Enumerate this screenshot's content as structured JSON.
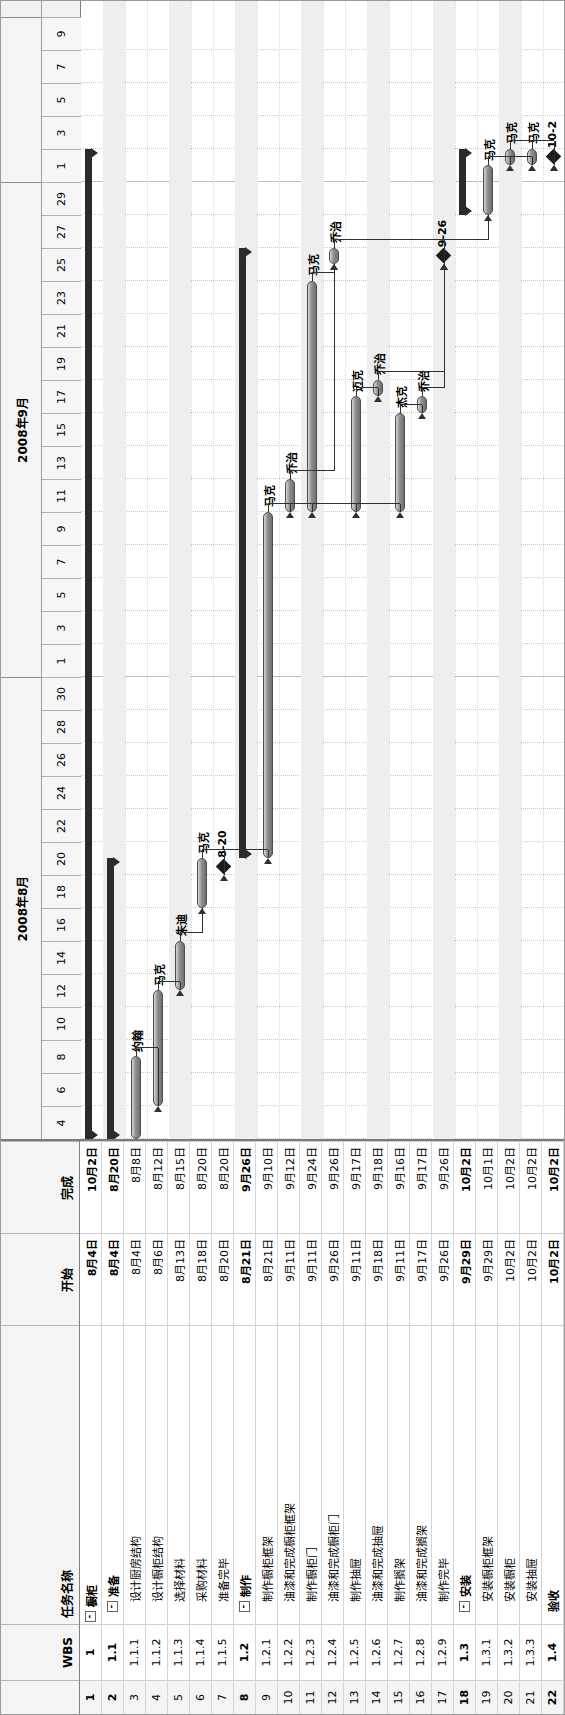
{
  "app": {
    "view": "gantt-chart",
    "orientation": "rotated-90-ccw"
  },
  "table": {
    "headers": {
      "id": "",
      "wbs": "WBS",
      "name": "任务名称",
      "start": "开始",
      "finish": "完成"
    },
    "rows": [
      {
        "id": "1",
        "wbs": "1",
        "name": "橱柜",
        "start": "8月4日",
        "finish": "10月2日",
        "level": 1,
        "collapse": "-",
        "summary": true
      },
      {
        "id": "2",
        "wbs": "1.1",
        "name": "准备",
        "start": "8月4日",
        "finish": "8月20日",
        "level": 2,
        "collapse": "-",
        "summary": true
      },
      {
        "id": "3",
        "wbs": "1.1.1",
        "name": "设计厨房结构",
        "start": "8月4日",
        "finish": "8月8日",
        "level": 3,
        "collapse": "",
        "summary": false
      },
      {
        "id": "4",
        "wbs": "1.1.2",
        "name": "设计橱柜结构",
        "start": "8月6日",
        "finish": "8月12日",
        "level": 3,
        "collapse": "",
        "summary": false
      },
      {
        "id": "5",
        "wbs": "1.1.3",
        "name": "选择材料",
        "start": "8月13日",
        "finish": "8月15日",
        "level": 3,
        "collapse": "",
        "summary": false
      },
      {
        "id": "6",
        "wbs": "1.1.4",
        "name": "采购材料",
        "start": "8月18日",
        "finish": "8月20日",
        "level": 3,
        "collapse": "",
        "summary": false
      },
      {
        "id": "7",
        "wbs": "1.1.5",
        "name": "准备完毕",
        "start": "8月20日",
        "finish": "8月20日",
        "level": 3,
        "collapse": "",
        "summary": false
      },
      {
        "id": "8",
        "wbs": "1.2",
        "name": "制作",
        "start": "8月21日",
        "finish": "9月26日",
        "level": 2,
        "collapse": "-",
        "summary": true
      },
      {
        "id": "9",
        "wbs": "1.2.1",
        "name": "制作橱柜框架",
        "start": "8月21日",
        "finish": "9月10日",
        "level": 3,
        "collapse": "",
        "summary": false
      },
      {
        "id": "10",
        "wbs": "1.2.2",
        "name": "油漆和完成橱柜框架",
        "start": "9月11日",
        "finish": "9月12日",
        "level": 3,
        "collapse": "",
        "summary": false
      },
      {
        "id": "11",
        "wbs": "1.2.3",
        "name": "制作橱柜门",
        "start": "9月11日",
        "finish": "9月24日",
        "level": 3,
        "collapse": "",
        "summary": false
      },
      {
        "id": "12",
        "wbs": "1.2.4",
        "name": "油漆和完成橱柜门",
        "start": "9月26日",
        "finish": "9月26日",
        "level": 3,
        "collapse": "",
        "summary": false
      },
      {
        "id": "13",
        "wbs": "1.2.5",
        "name": "制作抽屉",
        "start": "9月11日",
        "finish": "9月17日",
        "level": 3,
        "collapse": "",
        "summary": false
      },
      {
        "id": "14",
        "wbs": "1.2.6",
        "name": "油漆和完成抽屉",
        "start": "9月18日",
        "finish": "9月18日",
        "level": 3,
        "collapse": "",
        "summary": false
      },
      {
        "id": "15",
        "wbs": "1.2.7",
        "name": "制作搁架",
        "start": "9月11日",
        "finish": "9月16日",
        "level": 3,
        "collapse": "",
        "summary": false
      },
      {
        "id": "16",
        "wbs": "1.2.8",
        "name": "油漆和完成搁架",
        "start": "9月17日",
        "finish": "9月17日",
        "level": 3,
        "collapse": "",
        "summary": false
      },
      {
        "id": "17",
        "wbs": "1.2.9",
        "name": "制作完毕",
        "start": "9月26日",
        "finish": "9月26日",
        "level": 3,
        "collapse": "",
        "summary": false
      },
      {
        "id": "18",
        "wbs": "1.3",
        "name": "安装",
        "start": "9月29日",
        "finish": "10月2日",
        "level": 2,
        "collapse": "-",
        "summary": true
      },
      {
        "id": "19",
        "wbs": "1.3.1",
        "name": "安装橱柜框架",
        "start": "9月29日",
        "finish": "10月1日",
        "level": 3,
        "collapse": "",
        "summary": false
      },
      {
        "id": "20",
        "wbs": "1.3.2",
        "name": "安装橱柜",
        "start": "10月2日",
        "finish": "10月2日",
        "level": 3,
        "collapse": "",
        "summary": false
      },
      {
        "id": "21",
        "wbs": "1.3.3",
        "name": "安装抽屉",
        "start": "10月2日",
        "finish": "10月2日",
        "level": 3,
        "collapse": "",
        "summary": false
      },
      {
        "id": "22",
        "wbs": "1.4",
        "name": "验收",
        "start": "10月2日",
        "finish": "10月2日",
        "level": 2,
        "collapse": "",
        "summary": true
      }
    ]
  },
  "timeline": {
    "months": [
      {
        "label": "2008年8月",
        "start_day": 4,
        "end_day": 31
      },
      {
        "label": "2008年9月",
        "start_day": 1,
        "end_day": 30
      },
      {
        "label": "",
        "start_day": 1,
        "end_day": 9
      }
    ],
    "day_ticks": [
      "4",
      "6",
      "8",
      "10",
      "12",
      "14",
      "16",
      "18",
      "20",
      "22",
      "24",
      "26",
      "28",
      "30",
      "1",
      "3",
      "5",
      "7",
      "9",
      "11",
      "13",
      "15",
      "17",
      "19",
      "21",
      "23",
      "25",
      "27",
      "29",
      "1",
      "3",
      "5",
      "7",
      "9"
    ]
  },
  "chart_data": {
    "type": "gantt",
    "title": "",
    "x_axis_start": "2008-08-04",
    "x_axis_end": "2008-10-09",
    "tasks": [
      {
        "id": 1,
        "wbs": "1",
        "name": "橱柜",
        "start": "2008-08-04",
        "finish": "2008-10-02",
        "kind": "summary",
        "resource": ""
      },
      {
        "id": 2,
        "wbs": "1.1",
        "name": "准备",
        "start": "2008-08-04",
        "finish": "2008-08-20",
        "kind": "summary",
        "resource": ""
      },
      {
        "id": 3,
        "wbs": "1.1.1",
        "name": "设计厨房结构",
        "start": "2008-08-04",
        "finish": "2008-08-08",
        "kind": "task",
        "resource": "约翰"
      },
      {
        "id": 4,
        "wbs": "1.1.2",
        "name": "设计橱柜结构",
        "start": "2008-08-06",
        "finish": "2008-08-12",
        "kind": "task",
        "resource": "马克"
      },
      {
        "id": 5,
        "wbs": "1.1.3",
        "name": "选择材料",
        "start": "2008-08-13",
        "finish": "2008-08-15",
        "kind": "task",
        "resource": "朱迪"
      },
      {
        "id": 6,
        "wbs": "1.1.4",
        "name": "采购材料",
        "start": "2008-08-18",
        "finish": "2008-08-20",
        "kind": "task",
        "resource": "马克"
      },
      {
        "id": 7,
        "wbs": "1.1.5",
        "name": "准备完毕",
        "start": "2008-08-20",
        "finish": "2008-08-20",
        "kind": "milestone",
        "resource": "",
        "label": "8-20"
      },
      {
        "id": 8,
        "wbs": "1.2",
        "name": "制作",
        "start": "2008-08-21",
        "finish": "2008-09-26",
        "kind": "summary",
        "resource": ""
      },
      {
        "id": 9,
        "wbs": "1.2.1",
        "name": "制作橱柜框架",
        "start": "2008-08-21",
        "finish": "2008-09-10",
        "kind": "task",
        "resource": "马克"
      },
      {
        "id": 10,
        "wbs": "1.2.2",
        "name": "油漆和完成橱柜框架",
        "start": "2008-09-11",
        "finish": "2008-09-12",
        "kind": "task",
        "resource": "乔治"
      },
      {
        "id": 11,
        "wbs": "1.2.3",
        "name": "制作橱柜门",
        "start": "2008-09-11",
        "finish": "2008-09-24",
        "kind": "task",
        "resource": "马克"
      },
      {
        "id": 12,
        "wbs": "1.2.4",
        "name": "油漆和完成橱柜门",
        "start": "2008-09-26",
        "finish": "2008-09-26",
        "kind": "task",
        "resource": "乔治"
      },
      {
        "id": 13,
        "wbs": "1.2.5",
        "name": "制作抽屉",
        "start": "2008-09-11",
        "finish": "2008-09-17",
        "kind": "task",
        "resource": "迈克"
      },
      {
        "id": 14,
        "wbs": "1.2.6",
        "name": "油漆和完成抽屉",
        "start": "2008-09-18",
        "finish": "2008-09-18",
        "kind": "task",
        "resource": "乔治"
      },
      {
        "id": 15,
        "wbs": "1.2.7",
        "name": "制作搁架",
        "start": "2008-09-11",
        "finish": "2008-09-16",
        "kind": "task",
        "resource": "杰克"
      },
      {
        "id": 16,
        "wbs": "1.2.8",
        "name": "油漆和完成搁架",
        "start": "2008-09-17",
        "finish": "2008-09-17",
        "kind": "task",
        "resource": "乔治"
      },
      {
        "id": 17,
        "wbs": "1.2.9",
        "name": "制作完毕",
        "start": "2008-09-26",
        "finish": "2008-09-26",
        "kind": "milestone",
        "resource": "",
        "label": "9-26"
      },
      {
        "id": 18,
        "wbs": "1.3",
        "name": "安装",
        "start": "2008-09-29",
        "finish": "2008-10-02",
        "kind": "summary",
        "resource": ""
      },
      {
        "id": 19,
        "wbs": "1.3.1",
        "name": "安装橱柜框架",
        "start": "2008-09-29",
        "finish": "2008-10-01",
        "kind": "task",
        "resource": "马克"
      },
      {
        "id": 20,
        "wbs": "1.3.2",
        "name": "安装橱柜",
        "start": "2008-10-02",
        "finish": "2008-10-02",
        "kind": "task",
        "resource": "马克"
      },
      {
        "id": 21,
        "wbs": "1.3.3",
        "name": "安装抽屉",
        "start": "2008-10-02",
        "finish": "2008-10-02",
        "kind": "task",
        "resource": "马克"
      },
      {
        "id": 22,
        "wbs": "1.4",
        "name": "验收",
        "start": "2008-10-02",
        "finish": "2008-10-02",
        "kind": "milestone",
        "resource": "",
        "label": "10-2"
      }
    ],
    "resources": [
      "约翰",
      "马克",
      "朱迪",
      "乔治",
      "迈克",
      "杰克"
    ],
    "milestone_labels": [
      "8-20",
      "9-26",
      "10-2"
    ]
  },
  "colors": {
    "task_bar": "#8f8f8f",
    "summary_bar": "#2b2b2b",
    "milestone": "#1c1c1c",
    "header_bg": "#f2f2f2",
    "grid": "#c9c9c9"
  }
}
